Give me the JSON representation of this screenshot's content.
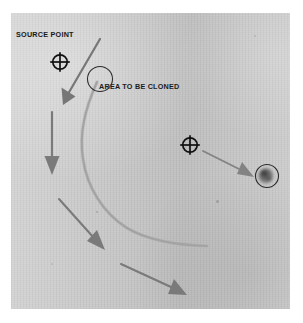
{
  "figure": {
    "background_color": "#ffffff",
    "plate_color": "#c9c9c9",
    "ink_color": "#1b1b1b",
    "arrow_color": "#7b7b7b",
    "labels": [
      {
        "id": "source-point",
        "text": "SOURCE POINT"
      },
      {
        "id": "area-to-be-cloned",
        "text": "AREA TO BE CLONED"
      }
    ],
    "markers": [
      {
        "id": "crosshair-source",
        "icon": "crosshair-target-icon",
        "x": 60,
        "y": 62
      },
      {
        "id": "crosshair-second",
        "icon": "crosshair-target-icon",
        "x": 190,
        "y": 145
      },
      {
        "id": "clone-area-circle",
        "icon": "circle-outline-icon",
        "x": 100,
        "y": 79,
        "r": 12
      },
      {
        "id": "blemish-circle",
        "icon": "circle-outline-icon",
        "x": 267,
        "y": 176,
        "r": 11
      }
    ],
    "arrows": [
      {
        "id": "arrow-source-to-area",
        "direction": "down-left"
      },
      {
        "id": "arrow-vertical-down",
        "direction": "down"
      },
      {
        "id": "arrow-lower-diagonal",
        "direction": "down-right"
      },
      {
        "id": "arrow-bottom-diagonal",
        "direction": "right-down"
      },
      {
        "id": "arrow-crosshair-to-blemish",
        "direction": "right-down"
      }
    ],
    "curve": {
      "id": "blemish-curve",
      "description": "curved scratch line"
    }
  }
}
